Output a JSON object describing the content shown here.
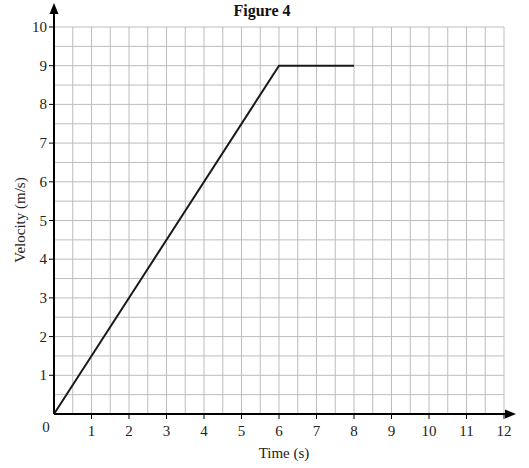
{
  "chart_data": {
    "type": "line",
    "title": "Figure 4",
    "xlabel": "Time (s)",
    "ylabel": "Velocity (m/s)",
    "xlim": [
      0,
      12
    ],
    "ylim": [
      0,
      10
    ],
    "x_ticks": [
      1,
      2,
      3,
      4,
      5,
      6,
      7,
      8,
      9,
      10,
      11,
      12
    ],
    "y_ticks": [
      1,
      2,
      3,
      4,
      5,
      6,
      7,
      8,
      9,
      10
    ],
    "origin_label": "0",
    "grid": true,
    "grid_step": 0.5,
    "legend": null,
    "series": [
      {
        "name": "velocity",
        "color": "#1a1a1a",
        "points": [
          [
            0,
            0
          ],
          [
            6,
            9
          ],
          [
            8,
            9
          ]
        ]
      }
    ]
  },
  "colors": {
    "grid": "#bdbdbd",
    "axis": "#000000",
    "line": "#1a1a1a"
  }
}
